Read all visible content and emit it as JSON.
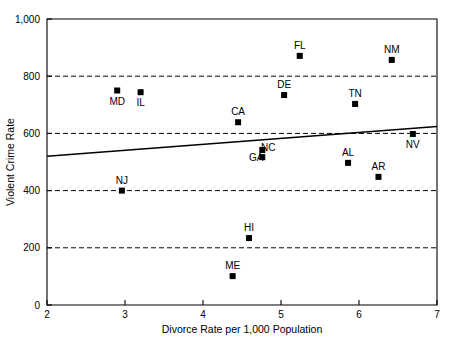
{
  "chart_data": {
    "type": "scatter",
    "title": "",
    "xlabel": "Divorce Rate per 1,000 Population",
    "ylabel": "Violent Crime Rate",
    "xlim": [
      2,
      7
    ],
    "ylim": [
      0,
      1000
    ],
    "xticks": [
      "2",
      "3",
      "4",
      "5",
      "6",
      "7"
    ],
    "xtick_values": [
      2,
      3,
      4,
      5,
      6,
      7
    ],
    "yticks": [
      "0",
      "200",
      "400",
      "600",
      "800",
      "1,000"
    ],
    "ytick_values": [
      0,
      200,
      400,
      600,
      800,
      1000
    ],
    "grid": "horizontal-dashed",
    "grid_values": [
      200,
      400,
      600,
      800
    ],
    "legend": "none",
    "marker_shape": "filled-square",
    "marker_color": "#000000",
    "points": [
      {
        "label": "MD",
        "x": 2.9,
        "y": 750
      },
      {
        "label": "IL",
        "x": 3.2,
        "y": 744
      },
      {
        "label": "NJ",
        "x": 2.96,
        "y": 400
      },
      {
        "label": "CA",
        "x": 4.45,
        "y": 639
      },
      {
        "label": "HI",
        "x": 4.59,
        "y": 234
      },
      {
        "label": "ME",
        "x": 4.38,
        "y": 101
      },
      {
        "label": "NC",
        "x": 4.76,
        "y": 542
      },
      {
        "label": "GA",
        "x": 4.76,
        "y": 517
      },
      {
        "label": "DE",
        "x": 5.04,
        "y": 734
      },
      {
        "label": "FL",
        "x": 5.24,
        "y": 871
      },
      {
        "label": "AL",
        "x": 5.86,
        "y": 497
      },
      {
        "label": "TN",
        "x": 5.95,
        "y": 703
      },
      {
        "label": "AR",
        "x": 6.25,
        "y": 448
      },
      {
        "label": "NM",
        "x": 6.42,
        "y": 857
      },
      {
        "label": "NV",
        "x": 6.69,
        "y": 598
      }
    ],
    "label_offsets": {
      "MD": "below",
      "IL": "below",
      "NJ": "above",
      "CA": "above",
      "HI": "above",
      "ME": "above",
      "NC": "right",
      "GA": "left",
      "DE": "above",
      "FL": "above",
      "AL": "above",
      "TN": "above",
      "AR": "above",
      "NM": "above",
      "NV": "below"
    },
    "trend_line": {
      "type": "linear-regression",
      "x_start": 2,
      "y_start": 520,
      "x_end": 7,
      "y_end": 624
    }
  },
  "caption": {
    "text": ""
  }
}
